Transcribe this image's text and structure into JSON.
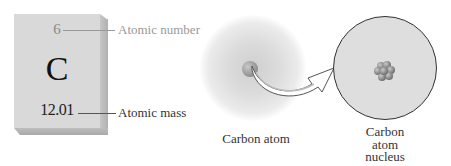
{
  "element_card": {
    "atomic_number": "6",
    "symbol": "C",
    "atomic_mass": "12.01"
  },
  "labels": {
    "atomic_number": "Atomic number",
    "atomic_mass": "Atomic mass"
  },
  "atom": {
    "caption": "Carbon atom"
  },
  "nucleus": {
    "caption_line1": "Carbon",
    "caption_line2": "atom",
    "caption_line3": "nucleus"
  },
  "colors": {
    "card_face": "#d9d9d9",
    "card_shadow": "#b9b9b9",
    "cloud": "#dcdcdc",
    "circle_fill": "#dedede",
    "outline": "#333333"
  }
}
